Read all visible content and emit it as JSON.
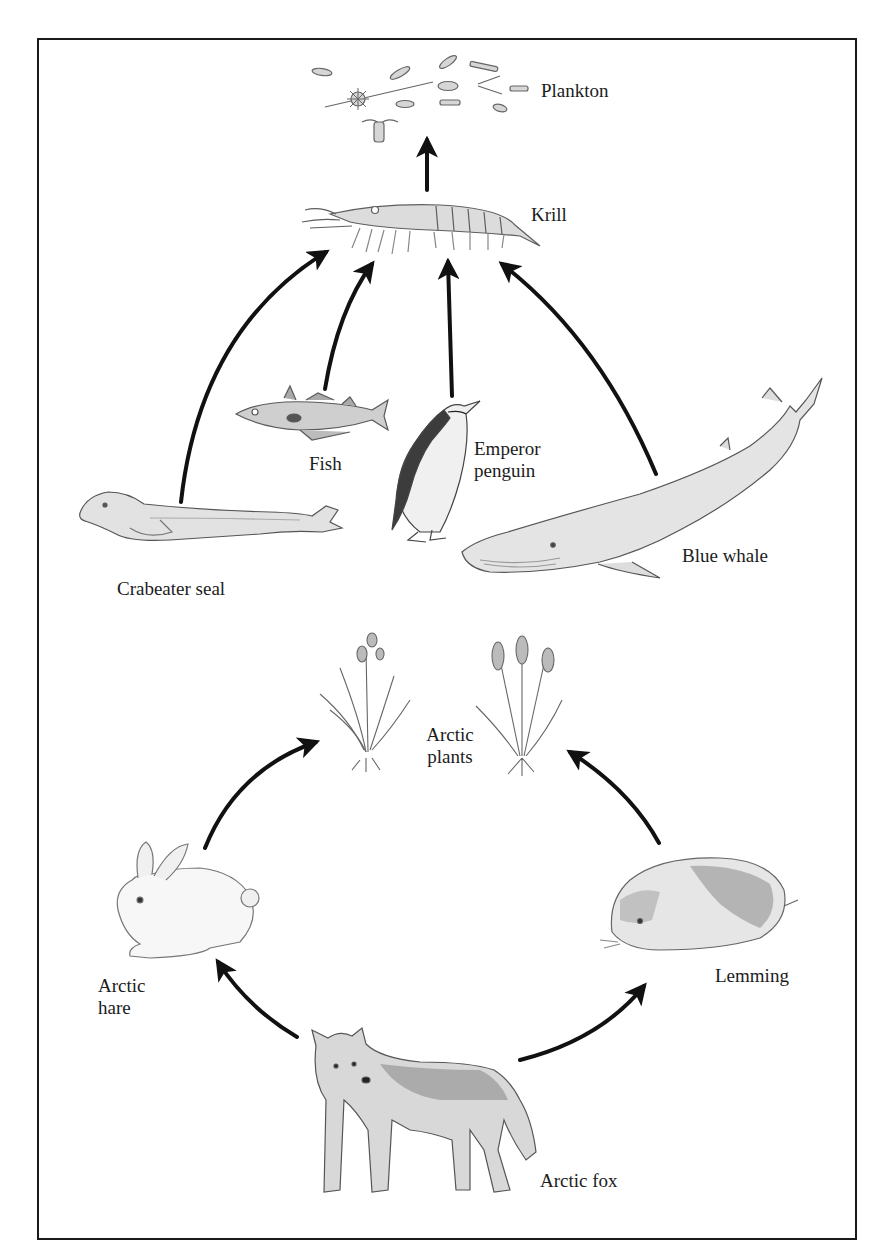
{
  "diagram": {
    "type": "food-web",
    "colors": {
      "border": "#1a1a1a",
      "arrow": "#111111",
      "sketch": "#6b6b6b",
      "shade": "#bdbdbd",
      "label": "#1c1c1c"
    },
    "marine_web": {
      "organisms": [
        {
          "id": "plankton",
          "label": "Plankton"
        },
        {
          "id": "krill",
          "label": "Krill"
        },
        {
          "id": "fish",
          "label": "Fish"
        },
        {
          "id": "emperor_penguin",
          "label_line1": "Emperor",
          "label_line2": "penguin"
        },
        {
          "id": "crabeater_seal",
          "label": "Crabeater seal"
        },
        {
          "id": "blue_whale",
          "label": "Blue whale"
        }
      ],
      "arrows": [
        {
          "from": "krill",
          "to": "plankton"
        },
        {
          "from": "crabeater_seal",
          "to": "krill"
        },
        {
          "from": "fish",
          "to": "krill"
        },
        {
          "from": "emperor_penguin",
          "to": "krill"
        },
        {
          "from": "blue_whale",
          "to": "krill"
        }
      ]
    },
    "arctic_web": {
      "organisms": [
        {
          "id": "arctic_plants",
          "label_line1": "Arctic",
          "label_line2": "plants"
        },
        {
          "id": "arctic_hare",
          "label_line1": "Arctic",
          "label_line2": "hare"
        },
        {
          "id": "lemming",
          "label": "Lemming"
        },
        {
          "id": "arctic_fox",
          "label": "Arctic fox"
        }
      ],
      "arrows": [
        {
          "from": "arctic_hare",
          "to": "arctic_plants"
        },
        {
          "from": "lemming",
          "to": "arctic_plants"
        },
        {
          "from": "arctic_fox",
          "to": "arctic_hare"
        },
        {
          "from": "arctic_fox",
          "to": "lemming"
        }
      ]
    }
  }
}
